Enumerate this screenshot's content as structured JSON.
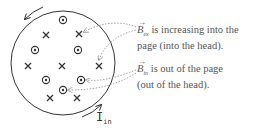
{
  "diagram": {
    "circle": {
      "cx": 63,
      "cy": 63,
      "r": 52,
      "stroke": "#333333"
    },
    "symbols": [
      {
        "type": "dot",
        "x": 63,
        "y": 20
      },
      {
        "type": "cross",
        "x": 46,
        "y": 35
      },
      {
        "type": "cross",
        "x": 79,
        "y": 34
      },
      {
        "type": "dot",
        "x": 35,
        "y": 50
      },
      {
        "type": "dot",
        "x": 78,
        "y": 50
      },
      {
        "type": "cross",
        "x": 28,
        "y": 66
      },
      {
        "type": "cross",
        "x": 62,
        "y": 66
      },
      {
        "type": "cross",
        "x": 99,
        "y": 66
      },
      {
        "type": "dot",
        "x": 46,
        "y": 80
      },
      {
        "type": "dot",
        "x": 81,
        "y": 80
      },
      {
        "type": "dot",
        "x": 63,
        "y": 90
      },
      {
        "type": "cross",
        "x": 50,
        "y": 98
      },
      {
        "type": "cross",
        "x": 77,
        "y": 98
      }
    ],
    "labels": {
      "b_ex": {
        "symbol": "B",
        "subscript": "ex",
        "line1": " is increasing into the",
        "line2": "page (into the head)."
      },
      "b_in": {
        "symbol": "B",
        "subscript": "in",
        "line1": " is out of the page",
        "line2": "(out of the head)."
      },
      "current": {
        "symbol": "I",
        "subscript": "in"
      }
    },
    "colors": {
      "line": "#333333",
      "dotted_arrow": "#999999",
      "label_text": "#555555"
    }
  }
}
